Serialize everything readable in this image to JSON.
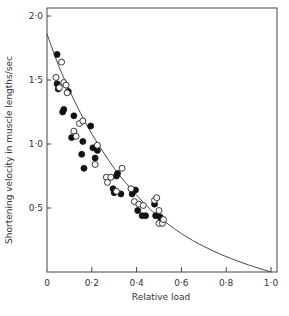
{
  "chart_data": {
    "type": "scatter",
    "title": "",
    "xlabel": "Relative load",
    "ylabel": "Shortening velocity in muscle lengths/sec",
    "xlim": [
      0,
      1.0
    ],
    "ylim": [
      0,
      2.0
    ],
    "x_ticks": [
      0,
      0.2,
      0.4,
      0.6,
      0.8,
      1.0
    ],
    "x_tick_labels": [
      "0",
      "0·2",
      "0·4",
      "0·6",
      "0·8",
      "1·0"
    ],
    "y_ticks": [
      0.5,
      1.0,
      1.5,
      2.0
    ],
    "y_tick_labels": [
      "0·5",
      "1·0",
      "1·5",
      "2·0"
    ],
    "grid": false,
    "legend": null,
    "series": [
      {
        "name": "filled circles",
        "marker": "filled-circle",
        "points": [
          [
            0.045,
            1.7
          ],
          [
            0.045,
            1.47
          ],
          [
            0.05,
            1.43
          ],
          [
            0.075,
            1.27
          ],
          [
            0.07,
            1.25
          ],
          [
            0.095,
            1.41
          ],
          [
            0.11,
            1.05
          ],
          [
            0.12,
            1.22
          ],
          [
            0.155,
            0.92
          ],
          [
            0.16,
            1.02
          ],
          [
            0.165,
            0.81
          ],
          [
            0.195,
            1.14
          ],
          [
            0.205,
            0.97
          ],
          [
            0.215,
            0.89
          ],
          [
            0.225,
            0.95
          ],
          [
            0.295,
            0.65
          ],
          [
            0.3,
            0.62
          ],
          [
            0.31,
            0.75
          ],
          [
            0.315,
            0.77
          ],
          [
            0.33,
            0.61
          ],
          [
            0.38,
            0.61
          ],
          [
            0.395,
            0.64
          ],
          [
            0.405,
            0.48
          ],
          [
            0.425,
            0.44
          ],
          [
            0.44,
            0.44
          ],
          [
            0.48,
            0.53
          ],
          [
            0.485,
            0.44
          ],
          [
            0.505,
            0.43
          ],
          [
            0.51,
            0.4
          ]
        ]
      },
      {
        "name": "open circles",
        "marker": "open-circle",
        "points": [
          [
            0.04,
            1.52
          ],
          [
            0.055,
            1.44
          ],
          [
            0.065,
            1.64
          ],
          [
            0.075,
            1.48
          ],
          [
            0.085,
            1.46
          ],
          [
            0.09,
            1.4
          ],
          [
            0.12,
            1.1
          ],
          [
            0.13,
            1.06
          ],
          [
            0.145,
            1.16
          ],
          [
            0.16,
            1.18
          ],
          [
            0.225,
            0.99
          ],
          [
            0.215,
            0.84
          ],
          [
            0.265,
            0.74
          ],
          [
            0.27,
            0.7
          ],
          [
            0.285,
            0.74
          ],
          [
            0.31,
            0.63
          ],
          [
            0.335,
            0.81
          ],
          [
            0.375,
            0.65
          ],
          [
            0.39,
            0.55
          ],
          [
            0.41,
            0.53
          ],
          [
            0.43,
            0.52
          ],
          [
            0.48,
            0.56
          ],
          [
            0.49,
            0.58
          ],
          [
            0.5,
            0.48
          ],
          [
            0.5,
            0.38
          ],
          [
            0.515,
            0.38
          ],
          [
            0.52,
            0.41
          ]
        ]
      }
    ],
    "fitted_curve": {
      "description": "hyperbolic force-velocity fit",
      "points": [
        [
          0,
          1.86
        ],
        [
          0.05,
          1.62
        ],
        [
          0.1,
          1.42
        ],
        [
          0.15,
          1.24
        ],
        [
          0.2,
          1.08
        ],
        [
          0.25,
          0.94
        ],
        [
          0.3,
          0.81
        ],
        [
          0.35,
          0.7
        ],
        [
          0.4,
          0.6
        ],
        [
          0.45,
          0.51
        ],
        [
          0.5,
          0.43
        ],
        [
          0.6,
          0.3
        ],
        [
          0.7,
          0.2
        ],
        [
          0.8,
          0.12
        ],
        [
          0.9,
          0.055
        ],
        [
          1.0,
          0.0
        ]
      ]
    }
  }
}
